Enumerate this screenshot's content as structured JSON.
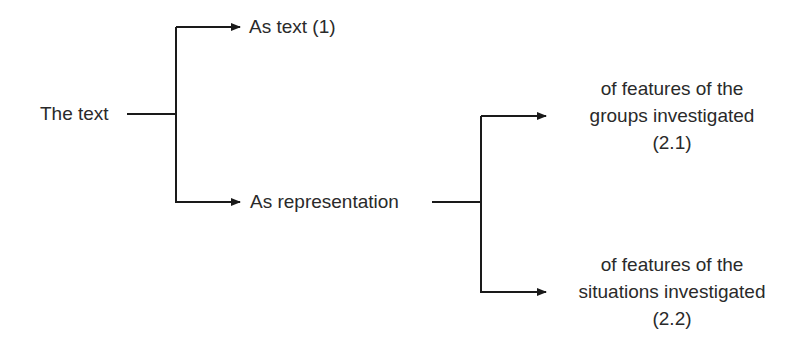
{
  "diagram": {
    "root": {
      "label": "The text"
    },
    "branches": [
      {
        "label": "As text (1)"
      },
      {
        "label": "As representation",
        "children": [
          {
            "lines": [
              "of features of the",
              "groups investigated",
              "(2.1)"
            ]
          },
          {
            "lines": [
              "of features of the",
              "situations investigated",
              "(2.2)"
            ]
          }
        ]
      }
    ],
    "colors": {
      "line": "#1a1a1a",
      "text": "#2a2a2a",
      "background": "#ffffff"
    }
  }
}
